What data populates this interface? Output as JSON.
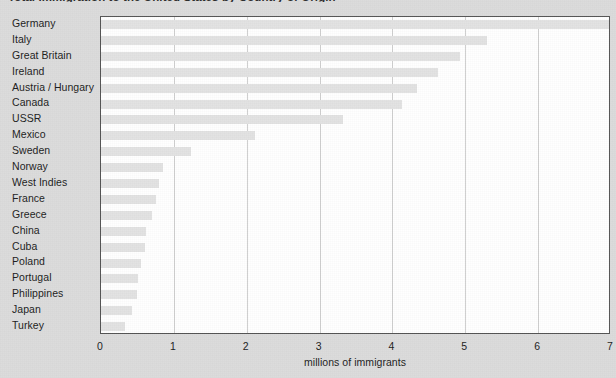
{
  "chart_data": {
    "type": "bar",
    "orientation": "horizontal",
    "title": "Total Immigration to the United States by Country of Origin",
    "title_clipped": true,
    "xlabel": "millions of immigrants",
    "ylabel": "",
    "xlim": [
      0,
      7
    ],
    "xticks": [
      0,
      1,
      2,
      3,
      4,
      5,
      6,
      7
    ],
    "xtick_labels": [
      "0",
      "1",
      "2",
      "3",
      "4",
      "5",
      "6",
      "7"
    ],
    "grid": "vertical",
    "legend": null,
    "bar_color": "#e3e3e3",
    "plot_background": "#ffffff",
    "page_background": "#dcdcdc",
    "frame_color": "#555555",
    "gridline_color": "#cfcfcf",
    "categories": [
      "Germany",
      "Italy",
      "Great Britain",
      "Ireland",
      "Austria / Hungary",
      "Canada",
      "USSR",
      "Mexico",
      "Sweden",
      "Norway",
      "West Indies",
      "France",
      "Greece",
      "China",
      "Cuba",
      "Poland",
      "Portugal",
      "Philippines",
      "Japan",
      "Turkey"
    ],
    "values": [
      7.0,
      5.3,
      4.93,
      4.63,
      4.34,
      4.13,
      3.32,
      2.12,
      1.24,
      0.85,
      0.8,
      0.75,
      0.7,
      0.62,
      0.6,
      0.55,
      0.51,
      0.5,
      0.42,
      0.33
    ]
  }
}
